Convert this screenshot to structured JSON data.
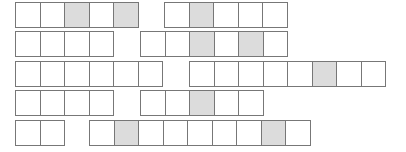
{
  "diagram": {
    "title": "",
    "cell_colors": {
      "empty": "#ffffff",
      "shaded": "#dcdcdc",
      "border": "#777777"
    },
    "rows": [
      {
        "strips": [
          {
            "x": 15,
            "y": 2,
            "cells": [
              0,
              0,
              1,
              0,
              1
            ]
          },
          {
            "x": 164,
            "y": 2,
            "cells": [
              0,
              1,
              0,
              0,
              0
            ]
          }
        ]
      },
      {
        "strips": [
          {
            "x": 15,
            "y": 31,
            "cells": [
              0,
              0,
              0,
              0
            ]
          },
          {
            "x": 140,
            "y": 31,
            "cells": [
              0,
              0,
              1,
              0,
              1,
              0
            ]
          }
        ]
      },
      {
        "strips": [
          {
            "x": 15,
            "y": 61,
            "cells": [
              0,
              0,
              0,
              0,
              0,
              0
            ]
          },
          {
            "x": 189,
            "y": 61,
            "cells": [
              0,
              0,
              0,
              0,
              0,
              1,
              0,
              0
            ]
          }
        ]
      },
      {
        "strips": [
          {
            "x": 15,
            "y": 90,
            "cells": [
              0,
              0,
              0,
              0
            ]
          },
          {
            "x": 140,
            "y": 90,
            "cells": [
              0,
              0,
              1,
              0,
              0
            ]
          }
        ]
      },
      {
        "strips": [
          {
            "x": 15,
            "y": 120,
            "cells": [
              0,
              0
            ]
          },
          {
            "x": 89,
            "y": 120,
            "cells": [
              0,
              1,
              0,
              0,
              0,
              0,
              0,
              1,
              0
            ]
          }
        ]
      }
    ]
  }
}
